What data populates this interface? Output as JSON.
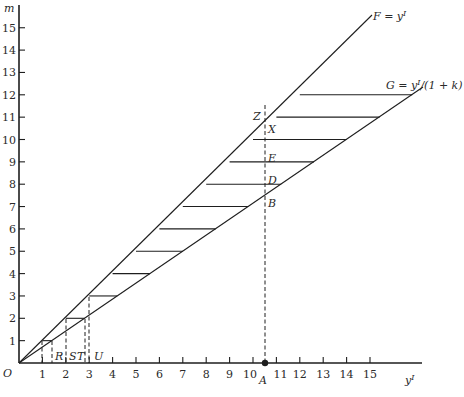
{
  "diagram": {
    "y_axis_label": "m",
    "x_axis_label": "y",
    "x_axis_label_sup": "I",
    "origin_label": "O",
    "y_ticks": [
      "1",
      "2",
      "3",
      "4",
      "5",
      "6",
      "7",
      "8",
      "9",
      "10",
      "11",
      "12",
      "13",
      "14",
      "15"
    ],
    "x_ticks": [
      "1",
      "2",
      "3",
      "4",
      "5",
      "6",
      "7",
      "8",
      "9",
      "10",
      "11",
      "12",
      "13",
      "14",
      "15"
    ],
    "line_F": {
      "label": "F = y",
      "sup": "I",
      "slope": 1
    },
    "line_G": {
      "label": "G = y",
      "sup": "I",
      "suffix": "/(1 + k)",
      "slope": 0.714
    },
    "step_levels": [
      1,
      2,
      3,
      4,
      5,
      6,
      7,
      8,
      9,
      10,
      11,
      12
    ],
    "point_labels": {
      "R": "R",
      "S": "S",
      "T": "T",
      "U": "U",
      "A": "A",
      "B": "B",
      "D": "D",
      "E": "E",
      "X": "X",
      "Z": "Z"
    },
    "A_value": 10.5
  },
  "chart_data": {
    "type": "line",
    "title": "",
    "xlabel": "y^I",
    "ylabel": "m",
    "xlim": [
      0,
      16
    ],
    "ylim": [
      0,
      16
    ],
    "series": [
      {
        "name": "F = y^I",
        "x": [
          0,
          15.0
        ],
        "values": [
          0,
          15.0
        ]
      },
      {
        "name": "G = y^I/(1 + k)",
        "x": [
          0,
          17.2
        ],
        "values": [
          0,
          12.3
        ]
      }
    ],
    "horizontal_segments_m": [
      1,
      2,
      3,
      4,
      5,
      6,
      7,
      8,
      9,
      10,
      11,
      12
    ],
    "annotations": [
      "O",
      "R",
      "S",
      "T",
      "U",
      "A",
      "B",
      "D",
      "E",
      "X",
      "Z"
    ]
  }
}
